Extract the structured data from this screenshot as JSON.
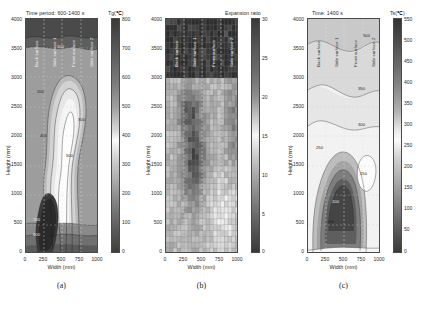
{
  "figure": {
    "background": "#ffffff",
    "panel_count": 3
  },
  "panels": [
    {
      "id": "a",
      "caption": "(a)",
      "title": "Time period: 600-1400 s",
      "colorbar_title": "Tg(℃)",
      "xlabel": "Width (mm)",
      "ylabel": "Height (mm)",
      "xticks": [
        "0",
        "250",
        "500",
        "750",
        "1000"
      ],
      "yticks": [
        "4000",
        "3500",
        "3000",
        "2500",
        "2000",
        "1500",
        "1000",
        "500",
        "0"
      ],
      "cbticks": [
        "800",
        "700",
        "600",
        "500",
        "400",
        "300",
        "200",
        "100",
        "0"
      ],
      "surface_labels": [
        "Back surface",
        "Side surface 1",
        "Front surface",
        "Side surface 2"
      ],
      "contour_labels": [
        "700",
        "600",
        "500",
        "400",
        "300",
        "200",
        "100"
      ]
    },
    {
      "id": "b",
      "caption": "(b)",
      "title": "",
      "colorbar_title": "Expansion ratio",
      "xlabel": "Width (mm)",
      "ylabel": "Height (mm)",
      "xticks": [
        "0",
        "250",
        "500",
        "750",
        "1000"
      ],
      "yticks": [
        "4000",
        "3500",
        "3000",
        "2500",
        "2000",
        "1500",
        "1000",
        "500",
        "0"
      ],
      "cbticks": [
        "30",
        "25",
        "20",
        "15",
        "10",
        "5",
        "0"
      ],
      "surface_labels": [
        "Back surface",
        "Side surface 1",
        "Front surface",
        "Side surface 2"
      ],
      "contour_labels": []
    },
    {
      "id": "c",
      "caption": "(c)",
      "title": "Time: 1400 s",
      "colorbar_title": "Ts(℃)",
      "xlabel": "Width (mm)",
      "ylabel": "Height (mm)",
      "xticks": [
        "0",
        "250",
        "500",
        "750",
        "1000"
      ],
      "yticks": [
        "4000",
        "3500",
        "3000",
        "2500",
        "2000",
        "1500",
        "1000",
        "500",
        "0"
      ],
      "cbticks": [
        "550",
        "500",
        "450",
        "400",
        "350",
        "300",
        "250",
        "200",
        "150",
        "100",
        "50",
        "0"
      ],
      "surface_labels": [
        "Back surface",
        "Side surface 1",
        "Front surface",
        "Side surface 2"
      ],
      "contour_labels": [
        "500",
        "350",
        "300",
        "250",
        "200",
        "150",
        "100"
      ]
    }
  ],
  "chart_data": [
    {
      "type": "heatmap",
      "panel": "a",
      "title": "Time period: 600-1400 s",
      "xlabel": "Width (mm)",
      "ylabel": "Height (mm)",
      "xlim": [
        0,
        1000
      ],
      "ylim": [
        0,
        4000
      ],
      "zlabel": "Tg(℃)",
      "zlim": [
        0,
        800
      ],
      "colormap": "gray-reversed",
      "grid": true,
      "legend": "colorbar-right",
      "contour_levels": [
        100,
        200,
        300,
        400,
        500,
        600,
        700
      ],
      "annotations": [
        "Back surface",
        "Side surface 1",
        "Front surface",
        "Side surface 2"
      ],
      "description": "Gas temperature contour map; hot core near x=250-400 mm at y=700-1500 mm, cool plume region centered near x=400-600 mm extending from y=1500 to y=3500 mm"
    },
    {
      "type": "heatmap",
      "panel": "b",
      "title": "",
      "xlabel": "Width (mm)",
      "ylabel": "Height (mm)",
      "xlim": [
        0,
        1000
      ],
      "ylim": [
        0,
        4000
      ],
      "zlabel": "Expansion ratio",
      "zlim": [
        0,
        30
      ],
      "colormap": "gray-reversed",
      "grid": true,
      "legend": "colorbar-right",
      "annotations": [
        "Back surface",
        "Side surface 1",
        "Front surface",
        "Side surface 2"
      ],
      "ncols": 20,
      "nrows": 40,
      "description": "Discrete cell grid of foam expansion ratio; high values (dark, 25-30) above y=3000 mm and in a band near x=250-500 mm between y=1000-2500 mm; low values (light, 0-10) scattered in the lower right quadrant"
    },
    {
      "type": "heatmap",
      "panel": "c",
      "title": "Time: 1400 s",
      "xlabel": "Width (mm)",
      "ylabel": "Height (mm)",
      "xlim": [
        0,
        1000
      ],
      "ylim": [
        0,
        4000
      ],
      "zlabel": "Ts(℃)",
      "zlim": [
        0,
        550
      ],
      "colormap": "gray-reversed",
      "grid": true,
      "legend": "colorbar-right",
      "contour_levels": [
        100,
        150,
        200,
        250,
        300,
        350,
        500
      ],
      "annotations": [
        "Back surface",
        "Side surface 1",
        "Front surface",
        "Side surface 2"
      ],
      "description": "Surface temperature contour map; hottest core (300+ ℃) near x=250-450 mm at y=600-1600 mm, cool (light) lobe near x=700-850 mm at y=1000-2000 mm"
    }
  ]
}
